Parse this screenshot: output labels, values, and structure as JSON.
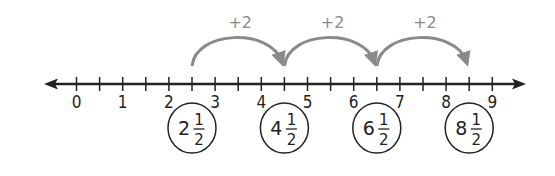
{
  "number_line": {
    "min": 0,
    "max": 9,
    "tick_step": 0.5,
    "labels": [
      "0",
      "1",
      "2",
      "3",
      "4",
      "5",
      "6",
      "7",
      "8",
      "9"
    ],
    "axis_color": "#222222"
  },
  "jumps": [
    {
      "from": 2.5,
      "to": 4.5,
      "label": "+2"
    },
    {
      "from": 4.5,
      "to": 6.5,
      "label": "+2"
    },
    {
      "from": 6.5,
      "to": 8.5,
      "label": "+2"
    }
  ],
  "jump_color": "#8a8a8a",
  "circled_values": [
    {
      "whole": "2",
      "numerator": "1",
      "denominator": "2",
      "value": 2.5
    },
    {
      "whole": "4",
      "numerator": "1",
      "denominator": "2",
      "value": 4.5
    },
    {
      "whole": "6",
      "numerator": "1",
      "denominator": "2",
      "value": 6.5
    },
    {
      "whole": "8",
      "numerator": "1",
      "denominator": "2",
      "value": 8.5
    }
  ]
}
